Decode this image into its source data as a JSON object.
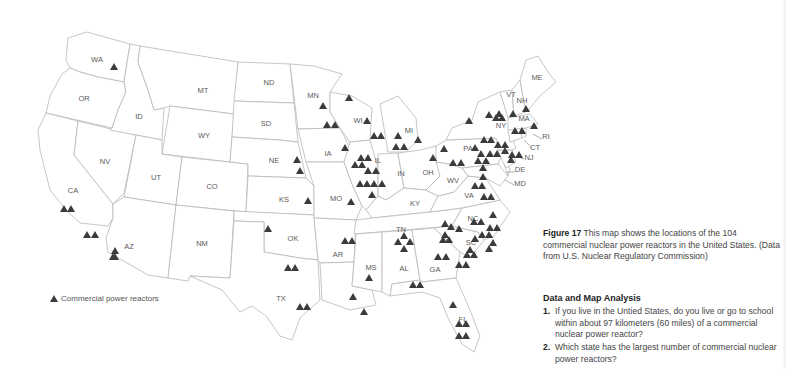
{
  "map": {
    "title": "Commercial nuclear power reactors in the United States",
    "state_labels": [
      {
        "code": "WA",
        "x": 97,
        "y": 62
      },
      {
        "code": "OR",
        "x": 84,
        "y": 101
      },
      {
        "code": "CA",
        "x": 73,
        "y": 193
      },
      {
        "code": "NV",
        "x": 105,
        "y": 164
      },
      {
        "code": "ID",
        "x": 139,
        "y": 119
      },
      {
        "code": "MT",
        "x": 203,
        "y": 93
      },
      {
        "code": "WY",
        "x": 204,
        "y": 138
      },
      {
        "code": "UT",
        "x": 156,
        "y": 180
      },
      {
        "code": "CO",
        "x": 212,
        "y": 189
      },
      {
        "code": "AZ",
        "x": 129,
        "y": 249
      },
      {
        "code": "NM",
        "x": 202,
        "y": 246
      },
      {
        "code": "ND",
        "x": 269,
        "y": 85
      },
      {
        "code": "SD",
        "x": 266,
        "y": 126
      },
      {
        "code": "NE",
        "x": 274,
        "y": 163
      },
      {
        "code": "KS",
        "x": 284,
        "y": 202
      },
      {
        "code": "OK",
        "x": 293,
        "y": 241
      },
      {
        "code": "TX",
        "x": 281,
        "y": 301
      },
      {
        "code": "MN",
        "x": 313,
        "y": 98
      },
      {
        "code": "IA",
        "x": 328,
        "y": 156
      },
      {
        "code": "MO",
        "x": 336,
        "y": 201
      },
      {
        "code": "AR",
        "x": 338,
        "y": 257
      },
      {
        "code": "LA",
        "x": 0,
        "y": 0
      },
      {
        "code": "WI",
        "x": 358,
        "y": 123
      },
      {
        "code": "IL",
        "x": 378,
        "y": 163
      },
      {
        "code": "MI",
        "x": 409,
        "y": 133
      },
      {
        "code": "IN",
        "x": 401,
        "y": 176
      },
      {
        "code": "OH",
        "x": 428,
        "y": 175
      },
      {
        "code": "KY",
        "x": 415,
        "y": 206
      },
      {
        "code": "TN",
        "x": 401,
        "y": 232
      },
      {
        "code": "MS",
        "x": 371,
        "y": 270
      },
      {
        "code": "AL",
        "x": 404,
        "y": 271
      },
      {
        "code": "GA",
        "x": 435,
        "y": 272
      },
      {
        "code": "FL",
        "x": 463,
        "y": 322
      },
      {
        "code": "SC",
        "x": 471,
        "y": 245
      },
      {
        "code": "NC",
        "x": 473,
        "y": 221
      },
      {
        "code": "VA",
        "x": 469,
        "y": 198
      },
      {
        "code": "WV",
        "x": 453,
        "y": 183
      },
      {
        "code": "PA",
        "x": 468,
        "y": 151
      },
      {
        "code": "NY",
        "x": 501,
        "y": 128
      },
      {
        "code": "VT",
        "x": 511,
        "y": 97
      },
      {
        "code": "NH",
        "x": 522,
        "y": 103
      },
      {
        "code": "ME",
        "x": 537,
        "y": 80
      },
      {
        "code": "MA",
        "x": 524,
        "y": 121
      },
      {
        "code": "RI",
        "x": 546,
        "y": 139
      },
      {
        "code": "CT",
        "x": 535,
        "y": 150
      },
      {
        "code": "NJ",
        "x": 529,
        "y": 160
      },
      {
        "code": "DE",
        "x": 520,
        "y": 172
      },
      {
        "code": "MD",
        "x": 520,
        "y": 186
      }
    ],
    "reactors": [
      [
        114,
        67
      ],
      [
        64,
        209
      ],
      [
        71,
        209
      ],
      [
        87,
        235
      ],
      [
        95,
        235
      ],
      [
        115,
        257
      ],
      [
        115,
        251
      ],
      [
        113,
        257
      ],
      [
        268,
        229
      ],
      [
        297,
        160
      ],
      [
        300,
        171
      ],
      [
        308,
        201
      ],
      [
        323,
        106
      ],
      [
        327,
        125
      ],
      [
        335,
        125
      ],
      [
        345,
        148
      ],
      [
        349,
        98
      ],
      [
        367,
        121
      ],
      [
        374,
        136
      ],
      [
        381,
        136
      ],
      [
        361,
        158
      ],
      [
        368,
        158
      ],
      [
        355,
        165
      ],
      [
        362,
        165
      ],
      [
        368,
        171
      ],
      [
        376,
        171
      ],
      [
        360,
        184
      ],
      [
        367,
        184
      ],
      [
        374,
        184
      ],
      [
        382,
        184
      ],
      [
        372,
        195
      ],
      [
        351,
        202
      ],
      [
        398,
        136
      ],
      [
        396,
        147
      ],
      [
        404,
        147
      ],
      [
        418,
        140
      ],
      [
        433,
        158
      ],
      [
        444,
        149
      ],
      [
        453,
        163
      ],
      [
        461,
        163
      ],
      [
        475,
        148
      ],
      [
        484,
        140
      ],
      [
        491,
        140
      ],
      [
        481,
        154
      ],
      [
        490,
        154
      ],
      [
        497,
        154
      ],
      [
        478,
        161
      ],
      [
        486,
        161
      ],
      [
        498,
        145
      ],
      [
        505,
        145
      ],
      [
        483,
        168
      ],
      [
        483,
        177
      ],
      [
        475,
        186
      ],
      [
        482,
        186
      ],
      [
        484,
        197
      ],
      [
        491,
        197
      ],
      [
        489,
        115
      ],
      [
        496,
        118
      ],
      [
        499,
        114
      ],
      [
        502,
        118
      ],
      [
        469,
        121
      ],
      [
        513,
        114
      ],
      [
        526,
        109
      ],
      [
        515,
        131
      ],
      [
        522,
        131
      ],
      [
        534,
        126
      ],
      [
        505,
        151
      ],
      [
        512,
        155
      ],
      [
        519,
        155
      ],
      [
        511,
        160
      ],
      [
        474,
        222
      ],
      [
        481,
        222
      ],
      [
        493,
        215
      ],
      [
        490,
        228
      ],
      [
        497,
        228
      ],
      [
        445,
        224
      ],
      [
        451,
        227
      ],
      [
        459,
        229
      ],
      [
        482,
        235
      ],
      [
        489,
        235
      ],
      [
        475,
        239
      ],
      [
        493,
        243
      ],
      [
        470,
        250
      ],
      [
        489,
        249
      ],
      [
        467,
        255
      ],
      [
        474,
        255
      ],
      [
        438,
        257
      ],
      [
        446,
        257
      ],
      [
        459,
        265
      ],
      [
        466,
        265
      ],
      [
        443,
        240
      ],
      [
        449,
        240
      ],
      [
        445,
        235
      ],
      [
        404,
        236
      ],
      [
        398,
        242
      ],
      [
        410,
        242
      ],
      [
        404,
        249
      ],
      [
        413,
        285
      ],
      [
        420,
        285
      ],
      [
        288,
        268
      ],
      [
        295,
        268
      ],
      [
        300,
        307
      ],
      [
        307,
        307
      ],
      [
        369,
        278
      ],
      [
        353,
        297
      ],
      [
        364,
        312
      ],
      [
        345,
        241
      ],
      [
        352,
        241
      ],
      [
        453,
        305
      ],
      [
        459,
        324
      ],
      [
        466,
        324
      ],
      [
        459,
        336
      ],
      [
        466,
        336
      ]
    ],
    "legend": {
      "symbol": "triangle",
      "label": "Commercial power reactors"
    },
    "colors": {
      "reactor": "#3b3b3b",
      "state_stroke": "#b8b8b8",
      "label": "#5a5a5a"
    }
  },
  "caption": {
    "figure_label": "Figure 17",
    "text": "This map shows the locations of the 104 commercial nuclear power reactors in the United States. (Data from U.S. Nuclear Regulatory Commission)"
  },
  "analysis": {
    "title": "Data and Map Analysis",
    "questions": [
      {
        "num": "1.",
        "text": "If you live in the Untied States, do you live or go to school within about 97 kilometers (60 miles) of a commercial nuclear power reactor?"
      },
      {
        "num": "2.",
        "text": "Which state has the largest number of commercial nuclear power reactors?"
      }
    ]
  }
}
